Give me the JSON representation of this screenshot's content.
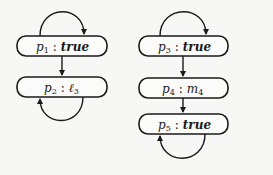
{
  "diagram": {
    "graphs": [
      {
        "nodes": [
          {
            "id": "p1",
            "var": "p",
            "index": "1",
            "value": "true"
          },
          {
            "id": "p2",
            "var": "p",
            "index": "2",
            "value": "ℓ",
            "value_index": "3"
          }
        ],
        "edges": [
          {
            "from": "p1",
            "to": "p1",
            "kind": "self-loop"
          },
          {
            "from": "p1",
            "to": "p2",
            "kind": "arrow"
          },
          {
            "from": "p2",
            "to": "p2",
            "kind": "self-loop"
          }
        ]
      },
      {
        "nodes": [
          {
            "id": "p3",
            "var": "p",
            "index": "3",
            "value": "true"
          },
          {
            "id": "p4",
            "var": "p",
            "index": "4",
            "value": "m",
            "value_index": "4"
          },
          {
            "id": "p5",
            "var": "p",
            "index": "5",
            "value": "true"
          }
        ],
        "edges": [
          {
            "from": "p3",
            "to": "p3",
            "kind": "self-loop"
          },
          {
            "from": "p3",
            "to": "p4",
            "kind": "arrow"
          },
          {
            "from": "p4",
            "to": "p5",
            "kind": "arrow"
          },
          {
            "from": "p5",
            "to": "p5",
            "kind": "self-loop"
          }
        ]
      }
    ],
    "separator": ":"
  }
}
